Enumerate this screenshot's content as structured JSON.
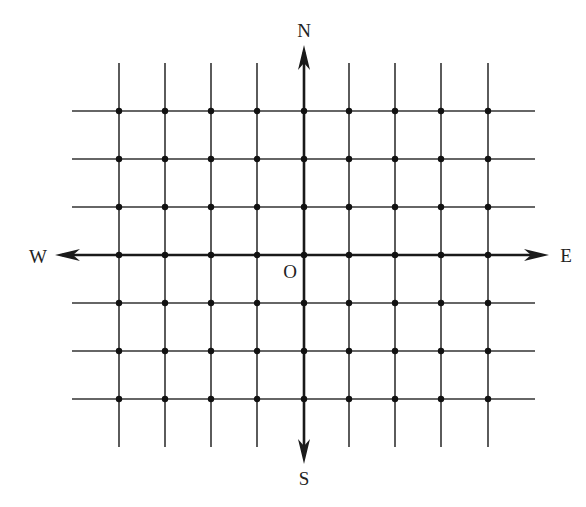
{
  "diagram": {
    "type": "grid-compass",
    "labels": {
      "north": "N",
      "south": "S",
      "east": "E",
      "west": "W",
      "origin": "O"
    },
    "grid": {
      "vertical_lines_x": [
        119,
        165,
        211,
        257,
        304,
        349,
        395,
        441,
        488
      ],
      "horizontal_lines_y": [
        111,
        159,
        207,
        255,
        303,
        351,
        399
      ],
      "axis_x_index": 4,
      "axis_y_index": 3,
      "vertical_span": [
        63,
        447
      ],
      "horizontal_span": [
        72,
        535
      ],
      "columns_west_of_origin": 4,
      "columns_east_of_origin": 4,
      "rows_north_of_origin": 3,
      "rows_south_of_origin": 3,
      "dots_at_every_intersection": true
    },
    "colors": {
      "line": "#333333",
      "axis": "#1a1a1a",
      "dot": "#111111",
      "text": "#222222",
      "background": "#ffffff"
    }
  }
}
